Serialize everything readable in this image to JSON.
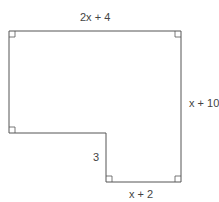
{
  "diagram": {
    "type": "L-shaped polygon with right angles",
    "labels": {
      "top": "2x + 4",
      "right": "x + 10",
      "step": "3",
      "bottom": "x + 2"
    },
    "stroke_color": "#555555"
  }
}
